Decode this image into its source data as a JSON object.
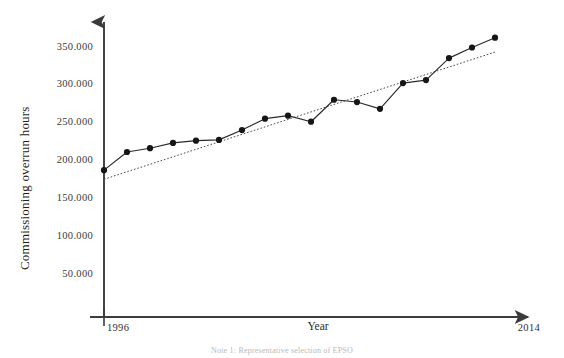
{
  "chart_data": {
    "type": "line",
    "title": "",
    "xlabel": "Year",
    "ylabel": "Commissioning overrun hours",
    "xlim": [
      1996,
      2014
    ],
    "ylim": [
      0,
      375000
    ],
    "grid": false,
    "legend": null,
    "x_axis_start_label": "1996",
    "x_axis_end_label": "2014",
    "y_tick_labels": [
      "350.000",
      "300.000",
      "250.000",
      "200.000",
      "150.000",
      "100.000",
      "50.000"
    ],
    "y_tick_values": [
      350000,
      300000,
      250000,
      200000,
      150000,
      100000,
      50000
    ],
    "x": [
      1996,
      1997,
      1998,
      1999,
      2000,
      2001,
      2002,
      2003,
      2004,
      2005,
      2006,
      2007,
      2008,
      2009,
      2010,
      2011,
      2012,
      2013
    ],
    "series": [
      {
        "name": "Commissioning overrun hours",
        "style": "solid-with-markers",
        "values": [
          186000,
          210000,
          215000,
          222000,
          225000,
          226000,
          239000,
          254000,
          258000,
          250000,
          279000,
          276000,
          267000,
          301000,
          305000,
          334000,
          348000,
          361000
        ]
      },
      {
        "name": "Linear trend",
        "style": "dotted",
        "values": [
          174000,
          184000,
          194000,
          204000,
          214000,
          224000,
          233000,
          243000,
          253000,
          263000,
          273000,
          283000,
          293000,
          302000,
          312000,
          322000,
          332000,
          342000
        ]
      }
    ]
  },
  "caption": {
    "note": "Note 1: Representative selection of EPSO"
  }
}
